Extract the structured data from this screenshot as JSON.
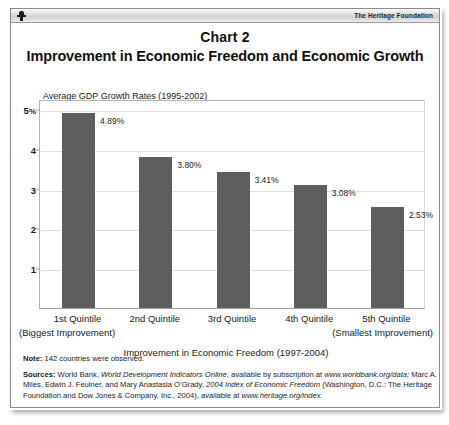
{
  "masthead": {
    "logo_icon": "heritage-torch-icon",
    "brand": "The Heritage Foundation"
  },
  "title": {
    "chart_label": "Chart 2",
    "chart_title": "Improvement in Economic Freedom and Economic Growth"
  },
  "chart_data": {
    "type": "bar",
    "title": "Improvement in Economic Freedom and Economic Growth",
    "subtitle": "Chart 2",
    "series_note": "Average GDP Growth Rates (1995-2002)",
    "categories": [
      "1st Quintile",
      "2nd Quintile",
      "3rd Quintile",
      "4th Quintile",
      "5th Quintile"
    ],
    "category_sublabels": {
      "first": "(Biggest Improvement)",
      "last": "(Smallest Improvement)"
    },
    "values": [
      4.89,
      3.8,
      3.41,
      3.08,
      2.53
    ],
    "value_labels": [
      "4.89%",
      "3.80%",
      "3.41%",
      "3.08%",
      "2.53%"
    ],
    "xlabel": "Improvement in Economic Freedom (1997-2004)",
    "ylabel": "Average GDP Growth Rates (1995-2002)",
    "ylim": [
      0,
      5.25
    ],
    "yticks": [
      1,
      2,
      3,
      4,
      5
    ],
    "ytick_labels": [
      "1",
      "2",
      "3",
      "4",
      "5%"
    ],
    "grid": true,
    "legend": "none",
    "bar_color": "#5e5e5e"
  },
  "axis": {
    "y_note": "Average GDP Growth Rates (1995-2002)",
    "y_ticks": [
      {
        "label": "5",
        "suffix": "%",
        "value": 5
      },
      {
        "label": "4",
        "suffix": "",
        "value": 4
      },
      {
        "label": "3",
        "suffix": "",
        "value": 3
      },
      {
        "label": "2",
        "suffix": "",
        "value": 2
      },
      {
        "label": "1",
        "suffix": "",
        "value": 1
      }
    ],
    "x_title": "Improvement in Economic Freedom (1997-2004)",
    "x_first_sub": "(Biggest Improvement)",
    "x_last_sub": "(Smallest Improvement)"
  },
  "footnotes": {
    "note_label": "Note:",
    "note_text": " 142 countries were observed.",
    "sources_label": "Sources:",
    "sources_part1": " World Bank, ",
    "sources_italic1": "World Development Indicators Online",
    "sources_part2": ", available by subscription at ",
    "sources_italic2": "www.worldbank.org/data;",
    "sources_part3": " Marc A. Miles, Edwin J. Feulner, and Mary Anastasia O’Grady, ",
    "sources_italic3": "2004 Index of Economic Freedom",
    "sources_part4": " (Washington, D.C.: The Heritage Foundation and Dow Jones & Company, Inc., 2004), available at ",
    "sources_italic4": "www.heritage.org/index."
  }
}
